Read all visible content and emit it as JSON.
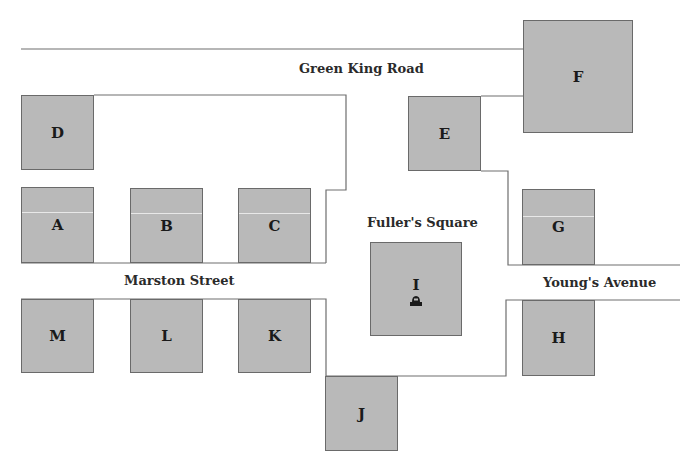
{
  "map": {
    "colors": {
      "building_fill": "#b9b9b9",
      "building_border": "#6a6a6a",
      "road_line": "#6e6e6e",
      "background": "#ffffff"
    },
    "roads": [
      {
        "id": "green-king-road",
        "label": "Green King Road"
      },
      {
        "id": "marston-street",
        "label": "Marston Street"
      },
      {
        "id": "youngs-avenue",
        "label": "Young's Avenue"
      },
      {
        "id": "fullers-square",
        "label": "Fuller's Square"
      }
    ],
    "buildings": {
      "A": "A",
      "B": "B",
      "C": "C",
      "D": "D",
      "E": "E",
      "F": "F",
      "G": "G",
      "H": "H",
      "I": "I",
      "J": "J",
      "K": "K",
      "L": "L",
      "M": "M"
    },
    "landmark_icon": "monument-icon"
  }
}
